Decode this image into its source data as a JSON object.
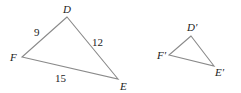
{
  "diagram": {
    "title": "",
    "triangle_large": {
      "vertices": {
        "D": {
          "label": "D",
          "x": 67,
          "y": 17
        },
        "F": {
          "label": "F",
          "x": 22,
          "y": 57
        },
        "E": {
          "label": "E",
          "x": 118,
          "y": 79
        }
      },
      "sides": {
        "DF": "9",
        "DE": "12",
        "FE": "15"
      }
    },
    "triangle_small": {
      "vertices": {
        "D": {
          "label": "D′",
          "x": 191,
          "y": 36
        },
        "F": {
          "label": "F′",
          "x": 169,
          "y": 55
        },
        "E": {
          "label": "E′",
          "x": 214,
          "y": 66
        }
      }
    },
    "colors": {
      "edge": "#8a8a8a",
      "text": "#222222"
    }
  }
}
